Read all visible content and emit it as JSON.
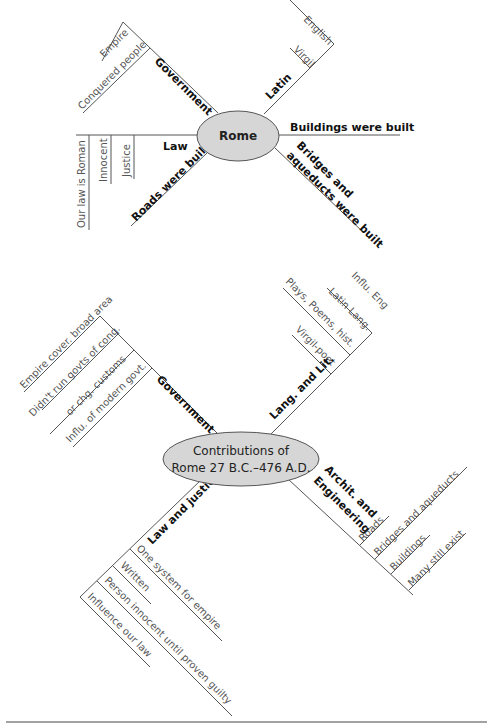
{
  "map1": {
    "center": "Rome",
    "government": {
      "label": "Government",
      "details": [
        "Empire",
        "Conquered people"
      ]
    },
    "latin": {
      "label": "Latin",
      "details": [
        "English",
        "Virgil"
      ]
    },
    "buildings": {
      "label": "Buildings were built"
    },
    "bridges": {
      "label_line1": "Bridges and",
      "label_line2": "aqueducts were built"
    },
    "law": {
      "label": "Law",
      "details": [
        "Our law is Roman",
        "Innocent",
        "Justice"
      ]
    },
    "roads": {
      "label": "Roads were built"
    }
  },
  "map2": {
    "center_line1": "Contributions of",
    "center_line2": "Rome 27 B.C.–476 A.D.",
    "government": {
      "label": "Government",
      "details": [
        "Empire cover. broad area",
        "Didn't run govts of conq.",
        "or chg. customs",
        "Influ. of modern govt."
      ]
    },
    "lang": {
      "label": "Lang. and Lit.",
      "details": [
        "Influ. Eng",
        "Latin Lang.",
        "Plays, Poems, hist.",
        "Virgil-poet"
      ]
    },
    "archit": {
      "label_line1": "Archit. and",
      "label_line2": "Engineering",
      "details": [
        "Roads",
        "Bridges and aqueducts",
        "Buildings",
        "Many still exist"
      ]
    },
    "law": {
      "label": "Law and justice",
      "details": [
        "One system for empire",
        "Written",
        "Person innocent until proven guilty",
        "Influence our law"
      ]
    }
  },
  "colors": {
    "ellipse_fill": "#d6d6d6",
    "line": "#555555"
  }
}
